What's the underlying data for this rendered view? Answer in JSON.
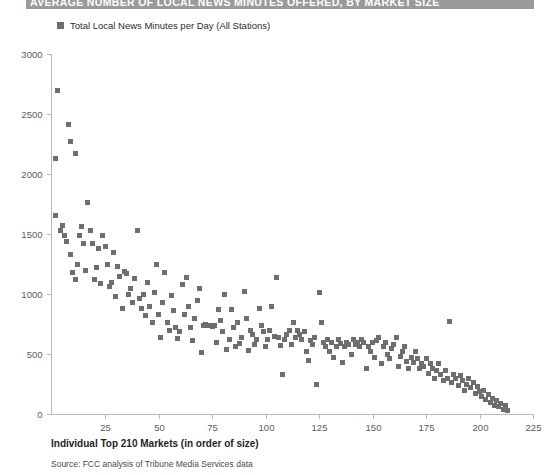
{
  "header": {
    "title": "AVERAGE NUMBER OF LOCAL NEWS MINUTES OFFERED, BY MARKET SIZE",
    "bar_color": "#9a9a9a"
  },
  "legend": {
    "items": [
      {
        "label": "Total Local News Minutes per Day (All Stations)",
        "color": "#6e6e6e"
      }
    ]
  },
  "footer": {
    "x_axis_title": "Individual Top 210 Markets (in order of size)",
    "source": "Source: FCC analysis of Tribune Media Services data"
  },
  "chart_data": {
    "type": "scatter",
    "title": "AVERAGE NUMBER OF LOCAL NEWS MINUTES OFFERED, BY MARKET SIZE",
    "xlabel": "Individual Top 210 Markets (in order of size)",
    "ylabel": "",
    "xlim": [
      0,
      225
    ],
    "ylim": [
      0,
      3000
    ],
    "xticks": [
      0,
      25,
      50,
      75,
      100,
      125,
      150,
      175,
      200,
      225
    ],
    "yticks": [
      0,
      500,
      1000,
      1500,
      2000,
      2500,
      3000
    ],
    "xtick_labels": [
      "0",
      "25",
      "50",
      "75",
      "100",
      "125",
      "150",
      "175",
      "200",
      "225"
    ],
    "ytick_labels": [
      "0",
      "500",
      "1000",
      "1500",
      "2000",
      "2500",
      "3000"
    ],
    "grid": false,
    "legend_position": "top-left",
    "marker": {
      "shape": "square",
      "color": "#6e6e6e",
      "size": 5
    },
    "series": [
      {
        "name": "Total Local News Minutes per Day (All Stations)",
        "points": [
          [
            2,
            2130
          ],
          [
            3,
            2700
          ],
          [
            8,
            2410
          ],
          [
            9,
            2270
          ],
          [
            11,
            2170
          ],
          [
            2,
            1650
          ],
          [
            4,
            1530
          ],
          [
            5,
            1570
          ],
          [
            6,
            1490
          ],
          [
            7,
            1440
          ],
          [
            9,
            1330
          ],
          [
            10,
            1180
          ],
          [
            11,
            1120
          ],
          [
            12,
            1250
          ],
          [
            13,
            1490
          ],
          [
            14,
            1560
          ],
          [
            15,
            1420
          ],
          [
            16,
            1200
          ],
          [
            17,
            1760
          ],
          [
            18,
            1530
          ],
          [
            19,
            1420
          ],
          [
            20,
            1120
          ],
          [
            21,
            1220
          ],
          [
            22,
            1380
          ],
          [
            23,
            1090
          ],
          [
            24,
            1490
          ],
          [
            25,
            1400
          ],
          [
            26,
            1250
          ],
          [
            27,
            1060
          ],
          [
            28,
            1100
          ],
          [
            29,
            1350
          ],
          [
            30,
            980
          ],
          [
            31,
            1230
          ],
          [
            32,
            1150
          ],
          [
            33,
            880
          ],
          [
            34,
            1190
          ],
          [
            35,
            1170
          ],
          [
            36,
            1000
          ],
          [
            37,
            1050
          ],
          [
            38,
            930
          ],
          [
            39,
            1130
          ],
          [
            40,
            1530
          ],
          [
            41,
            960
          ],
          [
            42,
            880
          ],
          [
            43,
            1000
          ],
          [
            44,
            820
          ],
          [
            45,
            1100
          ],
          [
            46,
            900
          ],
          [
            47,
            760
          ],
          [
            48,
            1010
          ],
          [
            49,
            1250
          ],
          [
            50,
            830
          ],
          [
            51,
            640
          ],
          [
            52,
            930
          ],
          [
            53,
            1180
          ],
          [
            54,
            760
          ],
          [
            55,
            700
          ],
          [
            56,
            990
          ],
          [
            57,
            860
          ],
          [
            58,
            720
          ],
          [
            59,
            630
          ],
          [
            60,
            690
          ],
          [
            61,
            1080
          ],
          [
            62,
            830
          ],
          [
            63,
            1140
          ],
          [
            64,
            900
          ],
          [
            65,
            720
          ],
          [
            66,
            610
          ],
          [
            67,
            800
          ],
          [
            68,
            950
          ],
          [
            69,
            1050
          ],
          [
            70,
            510
          ],
          [
            71,
            735
          ],
          [
            72,
            745
          ],
          [
            73,
            740
          ],
          [
            74,
            735
          ],
          [
            75,
            730
          ],
          [
            76,
            740
          ],
          [
            77,
            600
          ],
          [
            78,
            870
          ],
          [
            79,
            780
          ],
          [
            80,
            690
          ],
          [
            81,
            1000
          ],
          [
            82,
            540
          ],
          [
            83,
            620
          ],
          [
            84,
            870
          ],
          [
            85,
            720
          ],
          [
            86,
            560
          ],
          [
            87,
            760
          ],
          [
            88,
            590
          ],
          [
            89,
            640
          ],
          [
            90,
            1020
          ],
          [
            91,
            800
          ],
          [
            92,
            530
          ],
          [
            93,
            700
          ],
          [
            94,
            660
          ],
          [
            95,
            580
          ],
          [
            96,
            620
          ],
          [
            97,
            880
          ],
          [
            98,
            740
          ],
          [
            99,
            690
          ],
          [
            100,
            560
          ],
          [
            101,
            620
          ],
          [
            102,
            700
          ],
          [
            103,
            900
          ],
          [
            104,
            650
          ],
          [
            105,
            1140
          ],
          [
            106,
            640
          ],
          [
            107,
            570
          ],
          [
            108,
            330
          ],
          [
            109,
            620
          ],
          [
            110,
            660
          ],
          [
            111,
            700
          ],
          [
            112,
            580
          ],
          [
            113,
            760
          ],
          [
            114,
            640
          ],
          [
            115,
            700
          ],
          [
            116,
            660
          ],
          [
            117,
            620
          ],
          [
            118,
            690
          ],
          [
            119,
            520
          ],
          [
            120,
            450
          ],
          [
            121,
            610
          ],
          [
            122,
            580
          ],
          [
            123,
            640
          ],
          [
            124,
            250
          ],
          [
            125,
            1010
          ],
          [
            126,
            760
          ],
          [
            127,
            600
          ],
          [
            128,
            560
          ],
          [
            129,
            620
          ],
          [
            130,
            520
          ],
          [
            131,
            600
          ],
          [
            132,
            470
          ],
          [
            133,
            560
          ],
          [
            134,
            620
          ],
          [
            135,
            590
          ],
          [
            136,
            430
          ],
          [
            137,
            560
          ],
          [
            138,
            600
          ],
          [
            139,
            580
          ],
          [
            140,
            500
          ],
          [
            141,
            620
          ],
          [
            142,
            580
          ],
          [
            143,
            600
          ],
          [
            144,
            560
          ],
          [
            145,
            620
          ],
          [
            146,
            600
          ],
          [
            147,
            380
          ],
          [
            148,
            560
          ],
          [
            149,
            520
          ],
          [
            150,
            600
          ],
          [
            151,
            470
          ],
          [
            152,
            610
          ],
          [
            153,
            640
          ],
          [
            154,
            420
          ],
          [
            155,
            560
          ],
          [
            156,
            600
          ],
          [
            157,
            500
          ],
          [
            158,
            460
          ],
          [
            159,
            550
          ],
          [
            160,
            580
          ],
          [
            161,
            640
          ],
          [
            162,
            400
          ],
          [
            163,
            480
          ],
          [
            164,
            520
          ],
          [
            165,
            560
          ],
          [
            166,
            440
          ],
          [
            167,
            380
          ],
          [
            168,
            470
          ],
          [
            169,
            430
          ],
          [
            170,
            520
          ],
          [
            171,
            460
          ],
          [
            172,
            380
          ],
          [
            173,
            420
          ],
          [
            174,
            400
          ],
          [
            175,
            460
          ],
          [
            176,
            340
          ],
          [
            177,
            420
          ],
          [
            178,
            380
          ],
          [
            179,
            300
          ],
          [
            180,
            360
          ],
          [
            181,
            420
          ],
          [
            182,
            330
          ],
          [
            183,
            280
          ],
          [
            184,
            360
          ],
          [
            185,
            300
          ],
          [
            186,
            770
          ],
          [
            187,
            260
          ],
          [
            188,
            330
          ],
          [
            189,
            300
          ],
          [
            190,
            240
          ],
          [
            191,
            320
          ],
          [
            192,
            280
          ],
          [
            193,
            200
          ],
          [
            194,
            250
          ],
          [
            195,
            300
          ],
          [
            196,
            220
          ],
          [
            197,
            260
          ],
          [
            198,
            170
          ],
          [
            199,
            230
          ],
          [
            200,
            190
          ],
          [
            201,
            150
          ],
          [
            202,
            200
          ],
          [
            203,
            120
          ],
          [
            204,
            160
          ],
          [
            205,
            100
          ],
          [
            206,
            130
          ],
          [
            207,
            70
          ],
          [
            208,
            110
          ],
          [
            209,
            60
          ],
          [
            210,
            90
          ],
          [
            211,
            40
          ],
          [
            212,
            70
          ],
          [
            213,
            30
          ]
        ]
      }
    ]
  }
}
